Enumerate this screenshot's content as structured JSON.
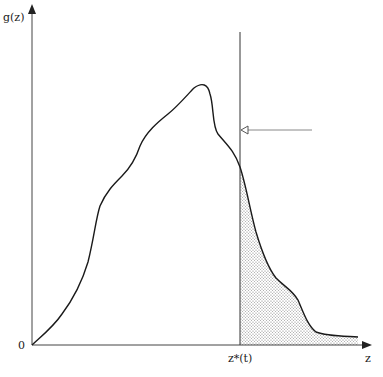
{
  "diagram": {
    "y_axis_label": "g(z)",
    "x_axis_label": "z",
    "origin_label": "0",
    "threshold_label": "z*(t)",
    "colors": {
      "curve": "#1a1a1a",
      "axis": "#333333",
      "shade": "#9a9a9a",
      "arrow": "#666666"
    }
  }
}
